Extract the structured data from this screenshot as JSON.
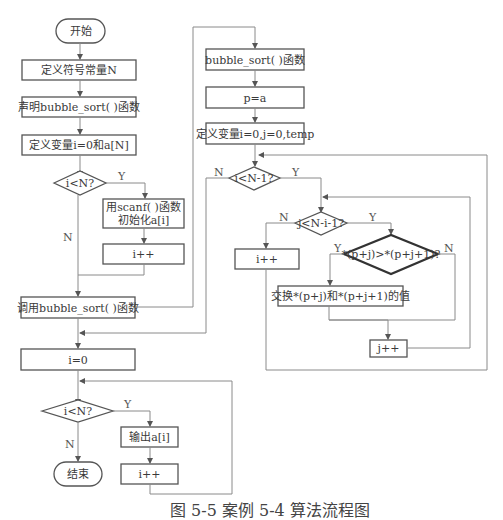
{
  "figure": {
    "caption": "图 5-5  案例 5-4 算法流程图"
  },
  "main_flow": {
    "start": "开始",
    "define_const": "定义符号常量N",
    "declare_func": "声明bubble_sort( )函数",
    "define_vars": "定义变量i=0和a[N]",
    "cond_input": "i<N?",
    "input_step_line1": "用scanf( )函数",
    "input_step_line2": "初始化a[i]",
    "input_inc": "i++",
    "call_sort": "调用bubble_sort( )函数",
    "reset_i": "i=0",
    "cond_output": "i<N?",
    "output_step": "输出a[i]",
    "output_inc": "i++",
    "end": "结束"
  },
  "sort_func": {
    "title": "bubble_sort( )函数",
    "assign_p": "p=a",
    "define_vars": "定义变量i=0,j=0,temp",
    "cond_outer": "i<N-1?",
    "cond_inner": "j<N-i-1?",
    "outer_inc": "i++",
    "cond_compare": "*(p+j)>*(p+j+1)?",
    "swap": "交换*(p+j)和*(p+j+1)的值",
    "inner_inc": "j++"
  },
  "branch_labels": {
    "yes": "Y",
    "no": "N"
  },
  "colors": {
    "stroke": "#555555",
    "connector": "#8a8a8a",
    "text": "#3a3a3a"
  }
}
